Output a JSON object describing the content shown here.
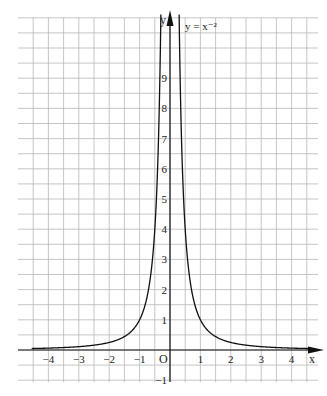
{
  "chart_data": {
    "type": "line",
    "title": "",
    "function_label": "y = x⁻²",
    "xlabel": "x",
    "ylabel": "y",
    "origin_label": "O",
    "x_ticks": [
      -4,
      -3,
      -2,
      -1,
      1,
      2,
      3,
      4
    ],
    "y_ticks": [
      -1,
      1,
      2,
      3,
      4,
      5,
      6,
      7,
      8,
      9
    ],
    "xlim": [
      -4.75,
      4.75
    ],
    "ylim": [
      -1.3,
      11.1
    ],
    "grid": true,
    "grid_step": 0.5,
    "series": [
      {
        "name": "y = x^-2",
        "x": [
          -4.5,
          -4,
          -3,
          -2,
          -1.5,
          -1,
          -0.75,
          -0.5,
          -0.4,
          -0.32,
          0.32,
          0.4,
          0.5,
          0.75,
          1,
          1.5,
          2,
          3,
          4,
          4.5
        ],
        "values": [
          0.049,
          0.0625,
          0.111,
          0.25,
          0.444,
          1,
          1.778,
          4,
          6.25,
          9.77,
          9.77,
          6.25,
          4,
          1.778,
          1,
          0.444,
          0.25,
          0.111,
          0.0625,
          0.049
        ]
      }
    ]
  }
}
